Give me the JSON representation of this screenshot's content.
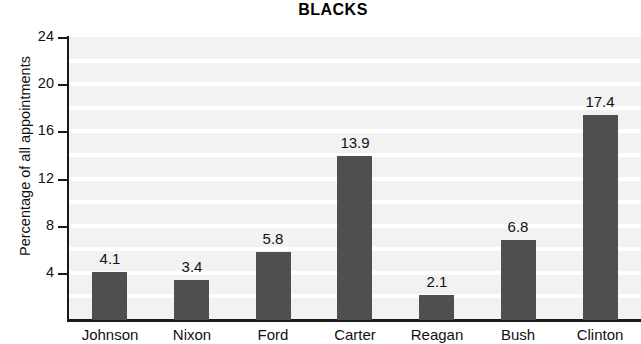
{
  "chart_data": {
    "type": "bar",
    "title": "BLACKS",
    "xlabel": "",
    "ylabel": "Percentage of all appointments",
    "categories": [
      "Johnson",
      "Nixon",
      "Ford",
      "Carter",
      "Reagan",
      "Bush",
      "Clinton"
    ],
    "values": [
      4.1,
      3.4,
      5.8,
      13.9,
      2.1,
      6.8,
      17.4
    ],
    "value_labels": [
      "4.1",
      "3.4",
      "5.8",
      "13.9",
      "2.1",
      "6.8",
      "17.4"
    ],
    "ylim": [
      0,
      24
    ],
    "yticks": [
      4,
      8,
      12,
      16,
      20,
      24
    ],
    "ytick_labels": [
      "4",
      "8",
      "12",
      "16",
      "20",
      "24"
    ],
    "grid": true,
    "grid_interval": 2,
    "legend": null,
    "bar_color": "#4f4f4f",
    "plot_background": "#f2f2f2",
    "gridline_color": "#ffffff",
    "axis_color": "#1a1a1a"
  }
}
